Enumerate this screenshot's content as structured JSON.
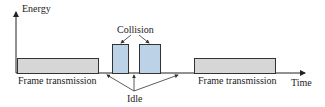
{
  "diagram": {
    "axes": {
      "y_label": "Energy",
      "x_label": "Time"
    },
    "labels": {
      "frame_left": "Frame transmission",
      "frame_right": "Frame transmission",
      "collision": "Collision",
      "idle": "Idle"
    },
    "colors": {
      "frame_fill": "#d6d6d6",
      "collision_fill": "#bcd2e6",
      "line": "#333333"
    },
    "segments": [
      {
        "type": "frame",
        "label": "Frame transmission"
      },
      {
        "type": "idle"
      },
      {
        "type": "collision"
      },
      {
        "type": "idle"
      },
      {
        "type": "collision"
      },
      {
        "type": "idle"
      },
      {
        "type": "frame",
        "label": "Frame transmission"
      }
    ]
  }
}
